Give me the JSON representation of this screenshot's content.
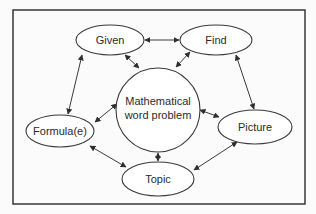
{
  "diagram": {
    "type": "concept-map",
    "frame": {
      "x": 13,
      "y": 10,
      "width": 292,
      "height": 194,
      "stroke": "#2a2a2a"
    },
    "colors": {
      "stroke": "#3a3a3a",
      "text": "#2a2a2a",
      "background": "#fbfbfb",
      "node_fill": "#ffffff"
    },
    "nodes": [
      {
        "id": "center",
        "shape": "circle",
        "cx": 158,
        "cy": 110,
        "r": 42,
        "lines": [
          "Mathematical",
          "word problem"
        ]
      },
      {
        "id": "given",
        "shape": "ellipse",
        "cx": 110,
        "cy": 40,
        "rx": 34,
        "ry": 15,
        "lines": [
          "Given"
        ]
      },
      {
        "id": "find",
        "shape": "ellipse",
        "cx": 216,
        "cy": 40,
        "rx": 36,
        "ry": 15,
        "lines": [
          "Find"
        ]
      },
      {
        "id": "formula",
        "shape": "ellipse",
        "cx": 60,
        "cy": 131,
        "rx": 34,
        "ry": 16,
        "lines": [
          "Formula(e)"
        ]
      },
      {
        "id": "picture",
        "shape": "ellipse",
        "cx": 255,
        "cy": 127,
        "rx": 37,
        "ry": 17,
        "lines": [
          "Picture"
        ]
      },
      {
        "id": "topic",
        "shape": "ellipse",
        "cx": 158,
        "cy": 179,
        "rx": 36,
        "ry": 17,
        "lines": [
          "Topic"
        ]
      }
    ],
    "edges": [
      {
        "from": "given",
        "to": "find",
        "bidirectional": true
      },
      {
        "from": "given",
        "to": "center",
        "bidirectional": true
      },
      {
        "from": "find",
        "to": "center",
        "bidirectional": true
      },
      {
        "from": "given",
        "to": "formula",
        "bidirectional": true
      },
      {
        "from": "find",
        "to": "picture",
        "bidirectional": true
      },
      {
        "from": "formula",
        "to": "center",
        "bidirectional": true
      },
      {
        "from": "picture",
        "to": "center",
        "bidirectional": true
      },
      {
        "from": "topic",
        "to": "center",
        "bidirectional": true
      },
      {
        "from": "formula",
        "to": "topic",
        "bidirectional": true
      },
      {
        "from": "picture",
        "to": "topic",
        "bidirectional": true
      }
    ]
  },
  "labels": {
    "center_line1": "Mathematical",
    "center_line2": "word problem",
    "given": "Given",
    "find": "Find",
    "formula": "Formula(e)",
    "picture": "Picture",
    "topic": "Topic"
  }
}
